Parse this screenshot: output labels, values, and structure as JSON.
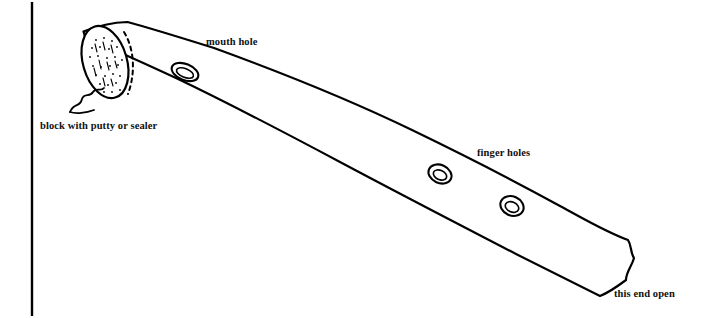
{
  "diagram": {
    "type": "line-drawing",
    "background_color": "#ffffff",
    "stroke_color": "#000000",
    "labels": [
      {
        "id": "mouth-hole",
        "text": "mouth hole",
        "x": 206,
        "y": 36
      },
      {
        "id": "block",
        "text": "block with putty or sealer",
        "x": 40,
        "y": 120
      },
      {
        "id": "finger-holes",
        "text": "finger holes",
        "x": 477,
        "y": 147
      },
      {
        "id": "end-open",
        "text": "this end open",
        "x": 614,
        "y": 288
      }
    ],
    "parts": {
      "left_border_rule": "vertical black rule at left margin",
      "tube_body": "long tapering wooden tube drawn in perspective from upper-left to lower-right",
      "end_cap": "stippled elliptical end face at upper left, closed by block",
      "squiggle_leader": "wavy leader line from block label to tube end",
      "holes": [
        {
          "name": "mouth hole",
          "cx": 185,
          "cy": 72
        },
        {
          "name": "finger hole 1",
          "cx": 440,
          "cy": 174
        },
        {
          "name": "finger hole 2",
          "cx": 512,
          "cy": 206
        }
      ]
    }
  }
}
